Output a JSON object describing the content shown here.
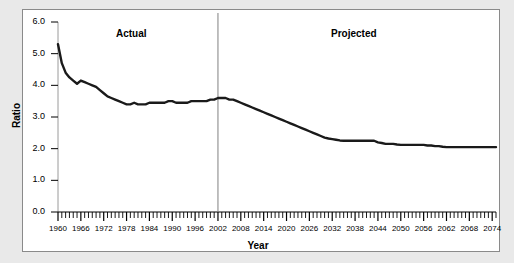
{
  "figure": {
    "background_color": "#e9e9e9",
    "panel_color": "#ffffff",
    "border_color": "#8a8a8a",
    "line_color": "#1a1a1a",
    "divider_color": "#808080"
  },
  "labels": {
    "actual": "Actual",
    "projected": "Projected",
    "ylabel": "Ratio",
    "xlabel": "Year"
  },
  "axes": {
    "y_ticks": [
      "6.0",
      "5.0",
      "4.0",
      "3.0",
      "2.0",
      "1.0",
      "0.0"
    ],
    "x_ticks": [
      "1960",
      "1966",
      "1972",
      "1978",
      "1984",
      "1990",
      "1996",
      "2002",
      "2008",
      "2014",
      "2020",
      "2026",
      "2032",
      "2038",
      "2044",
      "2050",
      "2056",
      "2062",
      "2068",
      "2074"
    ]
  },
  "chart_data": {
    "type": "line",
    "title": "",
    "subtitle": "",
    "xlabel": "Year",
    "ylabel": "Ratio",
    "xlim": [
      1960,
      2075
    ],
    "ylim": [
      0.0,
      6.0
    ],
    "grid": false,
    "legend_position": "inline-annotations",
    "annotations": [
      {
        "text": "Actual",
        "x": 1975,
        "y": 5.6,
        "note": "region left of 2002 divider"
      },
      {
        "text": "Projected",
        "x": 2041,
        "y": 5.6,
        "note": "region right of 2002 divider"
      }
    ],
    "divider": {
      "x": 2002,
      "style": "vertical thin gray line",
      "label": "actual/projected boundary"
    },
    "series": [
      {
        "name": "Covered workers per OASDI beneficiary",
        "x": [
          1960,
          1961,
          1962,
          1963,
          1964,
          1965,
          1966,
          1967,
          1968,
          1969,
          1970,
          1971,
          1972,
          1973,
          1974,
          1975,
          1976,
          1977,
          1978,
          1979,
          1980,
          1981,
          1982,
          1983,
          1984,
          1985,
          1986,
          1987,
          1988,
          1989,
          1990,
          1991,
          1992,
          1993,
          1994,
          1995,
          1996,
          1997,
          1998,
          1999,
          2000,
          2001,
          2002,
          2003,
          2004,
          2005,
          2006,
          2007,
          2008,
          2009,
          2010,
          2011,
          2012,
          2013,
          2014,
          2015,
          2016,
          2017,
          2018,
          2019,
          2020,
          2021,
          2022,
          2023,
          2024,
          2025,
          2026,
          2027,
          2028,
          2029,
          2030,
          2031,
          2032,
          2033,
          2034,
          2035,
          2036,
          2037,
          2038,
          2039,
          2040,
          2041,
          2042,
          2043,
          2044,
          2045,
          2046,
          2047,
          2048,
          2049,
          2050,
          2051,
          2052,
          2053,
          2054,
          2055,
          2056,
          2057,
          2058,
          2059,
          2060,
          2061,
          2062,
          2063,
          2064,
          2065,
          2066,
          2067,
          2068,
          2069,
          2070,
          2071,
          2072,
          2073,
          2074,
          2075
        ],
        "y": [
          5.3,
          4.7,
          4.4,
          4.25,
          4.15,
          4.05,
          4.15,
          4.1,
          4.05,
          4.0,
          3.95,
          3.85,
          3.75,
          3.65,
          3.6,
          3.55,
          3.5,
          3.45,
          3.4,
          3.4,
          3.45,
          3.4,
          3.4,
          3.4,
          3.45,
          3.45,
          3.45,
          3.45,
          3.45,
          3.5,
          3.5,
          3.45,
          3.45,
          3.45,
          3.45,
          3.5,
          3.5,
          3.5,
          3.5,
          3.5,
          3.55,
          3.55,
          3.6,
          3.6,
          3.6,
          3.55,
          3.55,
          3.5,
          3.45,
          3.4,
          3.35,
          3.3,
          3.25,
          3.2,
          3.15,
          3.1,
          3.05,
          3.0,
          2.95,
          2.9,
          2.85,
          2.8,
          2.75,
          2.7,
          2.65,
          2.6,
          2.55,
          2.5,
          2.45,
          2.4,
          2.35,
          2.32,
          2.3,
          2.28,
          2.26,
          2.25,
          2.25,
          2.25,
          2.25,
          2.25,
          2.25,
          2.25,
          2.25,
          2.25,
          2.2,
          2.18,
          2.15,
          2.15,
          2.15,
          2.13,
          2.12,
          2.12,
          2.12,
          2.12,
          2.12,
          2.12,
          2.12,
          2.1,
          2.1,
          2.08,
          2.08,
          2.06,
          2.05,
          2.05,
          2.05,
          2.05,
          2.05,
          2.05,
          2.05,
          2.05,
          2.05,
          2.05,
          2.05,
          2.05,
          2.05,
          2.05
        ]
      }
    ]
  }
}
